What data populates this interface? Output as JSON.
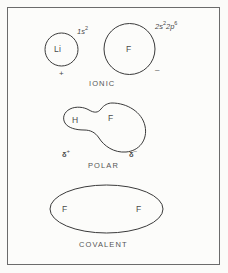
{
  "figure": {
    "background_color": "#fbfbf9",
    "border_color": "#6b6b6b",
    "stroke_color": "#3a3a3a",
    "text_color": "#4a4a4a"
  },
  "diagrams": [
    {
      "id": "ionic",
      "caption": "IONIC",
      "atoms": [
        {
          "symbol": "Li",
          "charge": "+",
          "configuration_base": "1",
          "configuration_orbital": "s",
          "configuration_exponent": "2"
        },
        {
          "symbol": "F",
          "charge": "–",
          "configuration": "2s²2p⁶"
        }
      ]
    },
    {
      "id": "polar",
      "caption": "POLAR",
      "atoms": [
        {
          "symbol": "H",
          "partial_charge_symbol": "δ",
          "partial_charge_sign": "+"
        },
        {
          "symbol": "F",
          "partial_charge_symbol": "δ",
          "partial_charge_sign": "–"
        }
      ]
    },
    {
      "id": "covalent",
      "caption": "COVALENT",
      "atoms": [
        {
          "symbol": "F"
        },
        {
          "symbol": "F"
        }
      ]
    }
  ],
  "labels": {
    "li_symbol": "Li",
    "li_config_num": "1",
    "li_config_orbital": "s",
    "li_config_exp": "2",
    "li_charge": "+",
    "f_ion_symbol": "F",
    "f_ion_charge": "–",
    "f_config_num1": "2",
    "f_config_orb1": "s",
    "f_config_exp1": "2",
    "f_config_num2": "2",
    "f_config_orb2": "p",
    "f_config_exp2": "6",
    "ionic_caption": "IONIC",
    "polar_h_symbol": "H",
    "polar_f_symbol": "F",
    "delta_symbol_left": "δ",
    "delta_sign_left": "+",
    "delta_symbol_right": "δ",
    "delta_sign_right": "–",
    "polar_caption": "POLAR",
    "covalent_f_left": "F",
    "covalent_f_right": "F",
    "covalent_caption": "COVALENT"
  }
}
